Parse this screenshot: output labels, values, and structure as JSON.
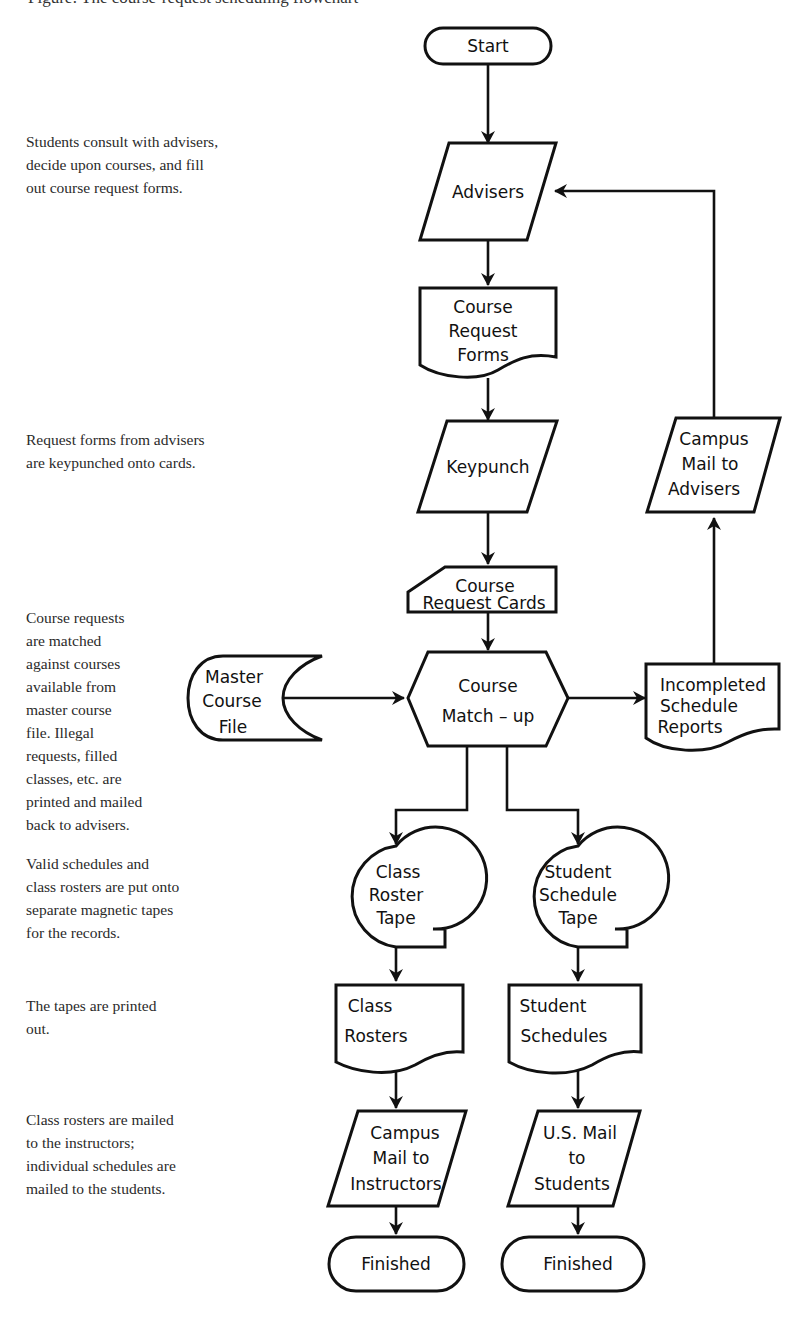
{
  "caption": "Figure: The course-request scheduling flowchart",
  "annotations": [
    {
      "id": "advisers",
      "top": 130,
      "lines": [
        "Students consult with advisers,",
        "decide upon courses, and fill",
        "out course request forms."
      ]
    },
    {
      "id": "keypunch",
      "top": 428,
      "lines": [
        "Request forms from advisers",
        "are keypunched onto cards."
      ]
    },
    {
      "id": "matchup",
      "top": 606,
      "lines": [
        "Course requests",
        "are matched",
        "against courses",
        "available from",
        "master course",
        "file.  Illegal",
        "requests, filled",
        "classes, etc. are",
        "printed and mailed",
        "back to advisers."
      ]
    },
    {
      "id": "tapes",
      "top": 852,
      "lines": [
        "Valid schedules and",
        "class rosters are put onto",
        "separate magnetic tapes",
        "for the records."
      ]
    },
    {
      "id": "print",
      "top": 994,
      "lines": [
        "The tapes are printed",
        "out."
      ]
    },
    {
      "id": "mail",
      "top": 1108,
      "lines": [
        "Class rosters are mailed",
        "to the instructors;",
        "individual schedules are",
        "mailed to the students."
      ]
    }
  ],
  "nodes": [
    {
      "id": "start",
      "type": "terminal",
      "lines": [
        "Start"
      ]
    },
    {
      "id": "advisers",
      "type": "io",
      "lines": [
        "Advisers"
      ]
    },
    {
      "id": "forms",
      "type": "document",
      "lines": [
        "Course",
        "Request",
        "Forms"
      ]
    },
    {
      "id": "keypunch",
      "type": "io",
      "lines": [
        "Keypunch"
      ]
    },
    {
      "id": "cards",
      "type": "punched-card",
      "lines": [
        "Course",
        "Request Cards"
      ]
    },
    {
      "id": "master",
      "type": "online-storage",
      "lines": [
        "Master",
        "Course",
        "File"
      ]
    },
    {
      "id": "matchup",
      "type": "preparation",
      "lines": [
        "Course",
        "Match – up"
      ]
    },
    {
      "id": "incomplete",
      "type": "document",
      "lines": [
        "Incompleted",
        "Schedule",
        "Reports"
      ]
    },
    {
      "id": "campus_advisers",
      "type": "io",
      "lines": [
        "Campus",
        "Mail to",
        "Advisers"
      ]
    },
    {
      "id": "roster_tape",
      "type": "magnetic-tape",
      "lines": [
        "Class",
        "Roster",
        "Tape"
      ]
    },
    {
      "id": "schedule_tape",
      "type": "magnetic-tape",
      "lines": [
        "Student",
        "Schedule",
        "Tape"
      ]
    },
    {
      "id": "rosters",
      "type": "document",
      "lines": [
        "Class",
        "Rosters"
      ]
    },
    {
      "id": "schedules",
      "type": "document",
      "lines": [
        "Student",
        "Schedules"
      ]
    },
    {
      "id": "campus_instructors",
      "type": "io",
      "lines": [
        "Campus",
        "Mail to",
        "Instructors"
      ]
    },
    {
      "id": "us_mail",
      "type": "io",
      "lines": [
        "U.S. Mail",
        "to",
        "Students"
      ]
    },
    {
      "id": "finished_left",
      "type": "terminal",
      "lines": [
        "Finished"
      ]
    },
    {
      "id": "finished_right",
      "type": "terminal",
      "lines": [
        "Finished"
      ]
    }
  ],
  "edges": [
    {
      "from": "start",
      "to": "advisers"
    },
    {
      "from": "advisers",
      "to": "forms"
    },
    {
      "from": "forms",
      "to": "keypunch"
    },
    {
      "from": "keypunch",
      "to": "cards"
    },
    {
      "from": "cards",
      "to": "matchup"
    },
    {
      "from": "master",
      "to": "matchup"
    },
    {
      "from": "matchup",
      "to": "incomplete"
    },
    {
      "from": "incomplete",
      "to": "campus_advisers"
    },
    {
      "from": "campus_advisers",
      "to": "advisers"
    },
    {
      "from": "matchup",
      "to": "roster_tape"
    },
    {
      "from": "matchup",
      "to": "schedule_tape"
    },
    {
      "from": "roster_tape",
      "to": "rosters"
    },
    {
      "from": "schedule_tape",
      "to": "schedules"
    },
    {
      "from": "rosters",
      "to": "campus_instructors"
    },
    {
      "from": "schedules",
      "to": "us_mail"
    },
    {
      "from": "campus_instructors",
      "to": "finished_left"
    },
    {
      "from": "us_mail",
      "to": "finished_right"
    }
  ],
  "colors": {
    "stroke": "#111111",
    "background": "#ffffff",
    "text": "#111111"
  }
}
